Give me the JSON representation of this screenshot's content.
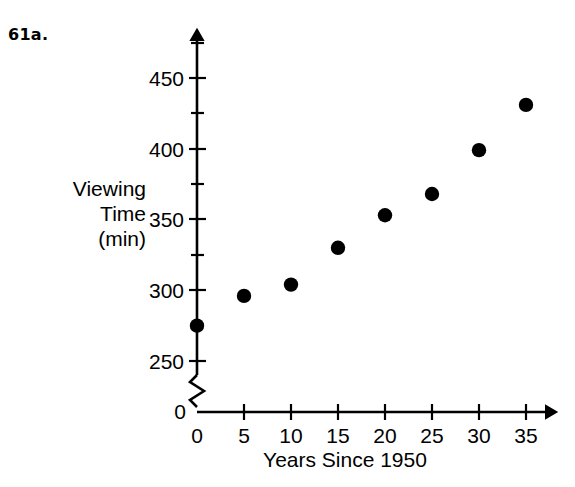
{
  "problem": {
    "number": "61a."
  },
  "chart_data": {
    "type": "scatter",
    "title": "",
    "xlabel": "Years Since 1950",
    "ylabel_lines": [
      "Viewing",
      "Time",
      "(min)"
    ],
    "ylabel": "Viewing Time (min)",
    "x": [
      0,
      5,
      10,
      15,
      20,
      25,
      30,
      35
    ],
    "values": [
      275,
      296,
      304,
      330,
      353,
      368,
      399,
      431
    ],
    "points": [
      {
        "x": 0,
        "y": 275
      },
      {
        "x": 5,
        "y": 296
      },
      {
        "x": 10,
        "y": 304
      },
      {
        "x": 15,
        "y": 330
      },
      {
        "x": 20,
        "y": 353
      },
      {
        "x": 25,
        "y": 368
      },
      {
        "x": 30,
        "y": 399
      },
      {
        "x": 35,
        "y": 431
      }
    ],
    "xlim": [
      0,
      35
    ],
    "ylim": [
      250,
      460
    ],
    "y_axis_break": true,
    "y_origin_label": "0",
    "xticks": [
      0,
      5,
      10,
      15,
      20,
      25,
      30,
      35
    ],
    "xtick_labels": [
      "0",
      "5",
      "10",
      "15",
      "20",
      "25",
      "30",
      "35"
    ],
    "yticks_major": [
      250,
      300,
      350,
      400,
      450
    ],
    "ytick_labels": [
      "250",
      "300",
      "350",
      "400",
      "450"
    ],
    "yticks_minor": [
      275,
      325,
      375,
      425
    ],
    "grid": false,
    "legend": false,
    "marker_color": "#000000",
    "axis_color": "#000000"
  }
}
